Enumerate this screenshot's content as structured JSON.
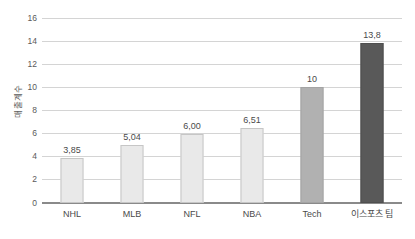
{
  "chart_data": {
    "type": "bar",
    "title": "",
    "xlabel": "",
    "ylabel": "매출계수",
    "ylim": [
      0,
      16
    ],
    "grid": true,
    "legend": "none",
    "categories": [
      "NHL",
      "MLB",
      "NFL",
      "NBA",
      "Tech",
      "이스포츠 팀"
    ],
    "values": [
      3.85,
      5.04,
      6.0,
      6.51,
      10,
      13.8
    ],
    "value_labels": [
      "3,85",
      "5,04",
      "6,00",
      "6,51",
      "10",
      "13,8"
    ],
    "y_ticks": [
      0,
      2,
      4,
      6,
      8,
      10,
      12,
      14,
      16
    ],
    "y_tick_labels": [
      "0",
      "2",
      "4",
      "6",
      "8",
      "10",
      "12",
      "14",
      "16"
    ],
    "bar_colors": [
      "#e9e9e9",
      "#e9e9e9",
      "#e9e9e9",
      "#e9e9e9",
      "#b1b1b1",
      "#595959"
    ]
  },
  "style": {
    "background": "#ffffff",
    "gridline_color": "#d4d4d4",
    "axis_color": "#8a8a8a",
    "text_color": "#4a4a4a",
    "tick_text_color": "#5a5a5a"
  }
}
